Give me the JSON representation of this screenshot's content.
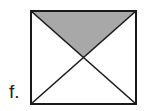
{
  "figure": {
    "label": "f.",
    "square": {
      "x1": 31,
      "y1": 11,
      "x2": 136,
      "y2": 104
    },
    "shaded_region": "top triangle formed by diagonals",
    "colors": {
      "stroke": "#1a1a1a",
      "fill": "#a8a8a8",
      "background": "#ffffff"
    }
  }
}
